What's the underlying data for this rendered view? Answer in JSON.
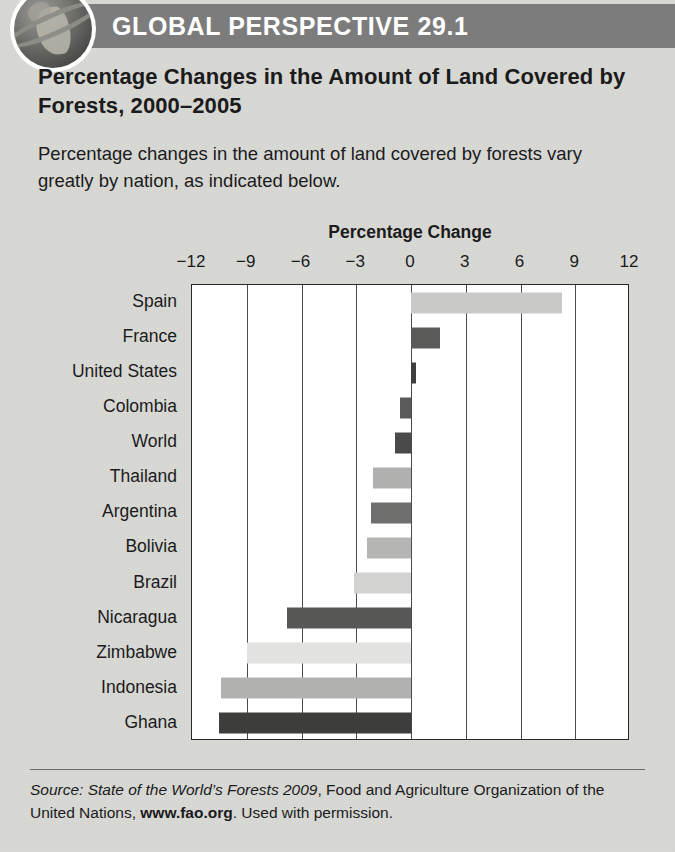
{
  "header": {
    "badge_title": "GLOBAL PERSPECTIVE 29.1",
    "globe_icon": "globe-icon",
    "band_color": "#7c7c7c"
  },
  "headline": "Percentage Changes in the Amount of Land Covered by Forests, 2000–2005",
  "blurb": "Percentage changes in the amount of land covered by forests vary greatly by nation, as indicated below.",
  "source": {
    "prefix_italic": "Source: State of the World’s Forests 2009",
    "mid": ", Food and Agriculture Organization of the United Nations, ",
    "link_bold": "www.fao.org",
    "suffix": ". Used with permission."
  },
  "chart_data": {
    "type": "bar",
    "orientation": "horizontal",
    "title": "Percentage Change",
    "xlabel": "Percentage Change",
    "ylabel": "",
    "xlim": [
      -12,
      12
    ],
    "xticks": [
      -12,
      -9,
      -6,
      -3,
      0,
      3,
      6,
      9,
      12
    ],
    "xticklabels": [
      "−12",
      "−9",
      "−6",
      "−3",
      "0",
      "3",
      "6",
      "9",
      "12"
    ],
    "grid": true,
    "legend": false,
    "categories": [
      "Spain",
      "France",
      "United States",
      "Colombia",
      "World",
      "Thailand",
      "Argentina",
      "Bolivia",
      "Brazil",
      "Nicaragua",
      "Zimbabwe",
      "Indonesia",
      "Ghana"
    ],
    "values": [
      8.3,
      1.6,
      0.3,
      -0.6,
      -0.9,
      -2.1,
      -2.2,
      -2.4,
      -3.1,
      -6.8,
      -9.0,
      -10.4,
      -10.5
    ],
    "bar_colors": [
      "#c9c9c7",
      "#5a5a58",
      "#3f3f3e",
      "#5a5a58",
      "#4a4a48",
      "#b0b0ae",
      "#6e6e6c",
      "#b5b5b3",
      "#d2d2d0",
      "#575755",
      "#e2e2e0",
      "#b1b1af",
      "#3d3d3b"
    ]
  }
}
